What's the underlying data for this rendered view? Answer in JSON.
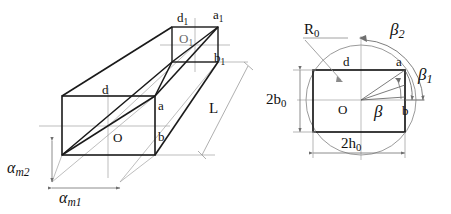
{
  "figure": {
    "colors": {
      "solid_edge": "#1a1a1a",
      "construction_line": "#9a9a9a",
      "dimension_line": "#6f6f6f",
      "circle_outline": "#8a8a8a",
      "background": "#ffffff"
    }
  },
  "left_view": {
    "name": "3D perspective of rectangular duct",
    "front_face": {
      "corner_top_label": "d",
      "corner_right_top_label": "a",
      "corner_right_bottom_label": "b",
      "center_label": "O"
    },
    "back_face": {
      "corner_top_label": "d",
      "corner_top_sub": "1",
      "corner_right_top_label": "a",
      "corner_right_top_sub": "1",
      "corner_right_bottom_label": "b",
      "corner_right_bottom_sub": "1",
      "center_label": "O",
      "center_sub": "1"
    },
    "length_label": "L",
    "dimensions": [
      {
        "symbol": "α",
        "sub": "m2",
        "orientation": "vertical"
      },
      {
        "symbol": "α",
        "sub": "m1",
        "orientation": "horizontal"
      }
    ]
  },
  "right_view": {
    "name": "Cross-section with circumscribed circle",
    "radius_label": "R",
    "radius_sub": "0",
    "center_label": "O",
    "corner_top_left_label": "d",
    "corner_top_right_label": "a",
    "corner_right_label": "b",
    "angle_beta": "β",
    "angle_beta1": "β",
    "angle_beta1_sub": "1",
    "angle_beta2": "β",
    "angle_beta2_sub": "2",
    "height_label": "2b",
    "height_sub": "0",
    "width_label": "2h",
    "width_sub": "0"
  }
}
